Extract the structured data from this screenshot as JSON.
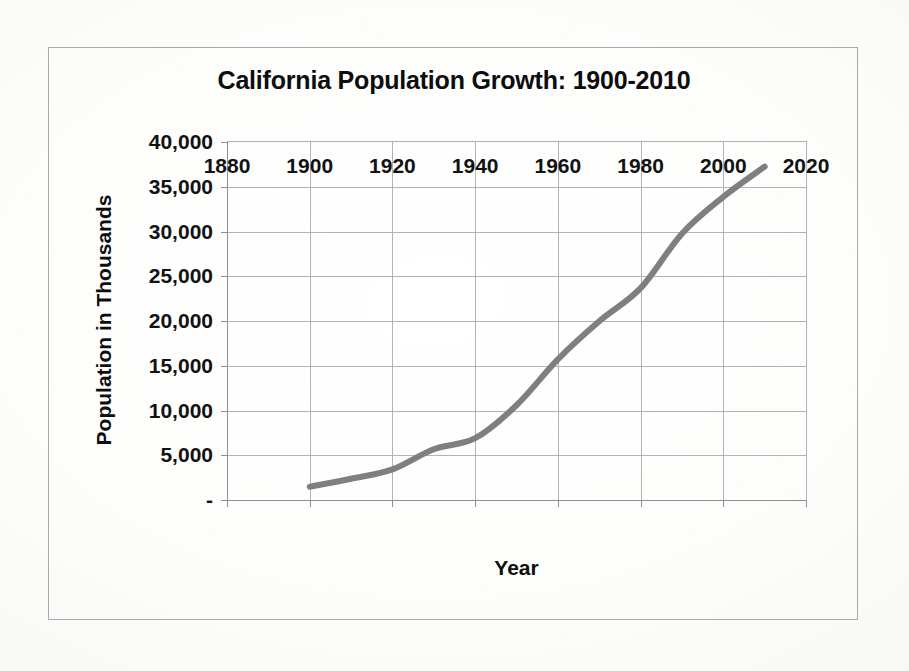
{
  "chart": {
    "title": "California Population Growth: 1900-2010",
    "x_axis_title": "Year",
    "y_axis_title": "Population in Thousands",
    "line_color": "#7f7f7f",
    "gridline_color": "#b3b3b3",
    "frame_color": "#a9a9a9"
  },
  "chart_data": {
    "type": "line",
    "title": "California Population Growth: 1900-2010",
    "xlabel": "Year",
    "ylabel": "Population in Thousands",
    "xlim": [
      1880,
      2020
    ],
    "ylim": [
      0,
      40000
    ],
    "xticks": [
      1880,
      1900,
      1920,
      1940,
      1960,
      1980,
      2000,
      2020
    ],
    "xtick_labels": [
      "1880",
      "1900",
      "1920",
      "1940",
      "1960",
      "1980",
      "2000",
      "2020"
    ],
    "yticks": [
      0,
      5000,
      10000,
      15000,
      20000,
      25000,
      30000,
      35000,
      40000
    ],
    "ytick_labels": [
      "-",
      "5,000",
      "10,000",
      "15,000",
      "20,000",
      "25,000",
      "30,000",
      "35,000",
      "40,000"
    ],
    "grid": true,
    "legend": false,
    "legend_position": "none",
    "x": [
      1900,
      1910,
      1920,
      1930,
      1940,
      1950,
      1960,
      1970,
      1980,
      1990,
      2000,
      2010
    ],
    "series": [
      {
        "name": "California population (thousands)",
        "values": [
          1485,
          2378,
          3427,
          5677,
          6907,
          10586,
          15717,
          19971,
          23668,
          29760,
          33872,
          37254
        ]
      }
    ]
  }
}
